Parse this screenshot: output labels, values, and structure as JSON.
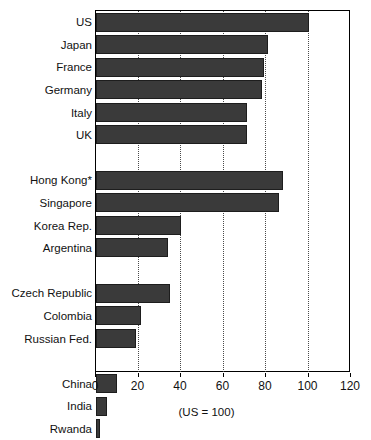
{
  "chart_data": {
    "type": "bar",
    "orientation": "horizontal",
    "title": "",
    "subtitle": "",
    "xlabel": "(US = 100)",
    "ylabel": "",
    "xlim": [
      0,
      120
    ],
    "xticks": [
      0,
      20,
      40,
      60,
      80,
      100,
      120
    ],
    "xtick_labels": [
      "0",
      "20",
      "40",
      "60",
      "80",
      "100",
      "120"
    ],
    "grid": "vertical dotted gridlines at 20, 40, 60, 80, 100",
    "legend": "none",
    "bar_color": "#3a3a3a",
    "categories": [
      "US",
      "Japan",
      "France",
      "Germany",
      "Italy",
      "UK",
      "Hong Kong*",
      "Singapore",
      "Korea Rep.",
      "Argentina",
      "Czech Republic",
      "Colombia",
      "Russian Fed.",
      "China",
      "India",
      "Rwanda"
    ],
    "values": [
      100,
      81,
      79,
      78,
      71,
      71,
      88,
      86,
      40,
      34,
      35,
      21,
      19,
      10,
      5,
      2
    ],
    "groups": [
      {
        "name": "",
        "categories": [
          "US",
          "Japan",
          "France",
          "Germany",
          "Italy",
          "UK"
        ]
      },
      {
        "name": "",
        "categories": [
          "Hong Kong*",
          "Singapore",
          "Korea Rep.",
          "Argentina"
        ]
      },
      {
        "name": "",
        "categories": [
          "Czech Republic",
          "Colombia",
          "Russian Fed."
        ]
      },
      {
        "name": "",
        "categories": [
          "China",
          "India",
          "Rwanda"
        ]
      }
    ],
    "annotations": [
      "(US = 100)"
    ]
  },
  "rows": [
    {
      "label": "US",
      "value": 100,
      "spacer": false
    },
    {
      "label": "Japan",
      "value": 81,
      "spacer": false
    },
    {
      "label": "France",
      "value": 79,
      "spacer": false
    },
    {
      "label": "Germany",
      "value": 78,
      "spacer": false
    },
    {
      "label": "Italy",
      "value": 71,
      "spacer": false
    },
    {
      "label": "UK",
      "value": 71,
      "spacer": false
    },
    {
      "label": "",
      "value": 0,
      "spacer": true
    },
    {
      "label": "Hong Kong*",
      "value": 88,
      "spacer": false
    },
    {
      "label": "Singapore",
      "value": 86,
      "spacer": false
    },
    {
      "label": "Korea Rep.",
      "value": 40,
      "spacer": false
    },
    {
      "label": "Argentina",
      "value": 34,
      "spacer": false
    },
    {
      "label": "",
      "value": 0,
      "spacer": true
    },
    {
      "label": "Czech Republic",
      "value": 35,
      "spacer": false
    },
    {
      "label": "Colombia",
      "value": 21,
      "spacer": false
    },
    {
      "label": "Russian Fed.",
      "value": 19,
      "spacer": false
    },
    {
      "label": "",
      "value": 0,
      "spacer": true
    },
    {
      "label": "China",
      "value": 10,
      "spacer": false
    },
    {
      "label": "India",
      "value": 5,
      "spacer": false
    },
    {
      "label": "Rwanda",
      "value": 2,
      "spacer": false
    }
  ],
  "axis": {
    "ticks": [
      {
        "value": 0,
        "label": "0"
      },
      {
        "value": 20,
        "label": "20"
      },
      {
        "value": 40,
        "label": "40"
      },
      {
        "value": 60,
        "label": "60"
      },
      {
        "value": 80,
        "label": "80"
      },
      {
        "value": 100,
        "label": "100"
      },
      {
        "value": 120,
        "label": "120"
      }
    ],
    "gridlines": [
      20,
      40,
      60,
      80,
      100
    ],
    "note": "(US = 100)"
  }
}
